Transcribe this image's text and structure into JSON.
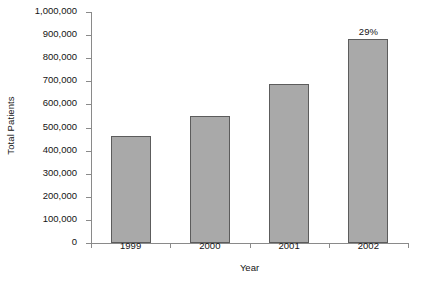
{
  "chart_data": {
    "type": "bar",
    "title": "",
    "xlabel": "Year",
    "ylabel": "Total Patients",
    "categories": [
      "1999",
      "2000",
      "2001",
      "2002"
    ],
    "values": [
      465000,
      548000,
      688000,
      882000
    ],
    "ylim": [
      0,
      1000000
    ],
    "ytick_values": [
      0,
      100000,
      200000,
      300000,
      400000,
      500000,
      600000,
      700000,
      800000,
      900000,
      1000000
    ],
    "ytick_labels": [
      "0",
      "100,000",
      "200,000",
      "300,000",
      "400,000",
      "500,000",
      "600,000",
      "700,000",
      "800,000",
      "900,000",
      "1,000,000"
    ],
    "grid": false,
    "legend": false,
    "annotations": [
      {
        "category": "2002",
        "text": "29%"
      }
    ],
    "bar_fill_color": "#a9a9a9",
    "bar_border_color": "#5c5c5c",
    "axis_color": "#8a8a8a",
    "text_color": "#141414",
    "background_color": "#ffffff"
  }
}
